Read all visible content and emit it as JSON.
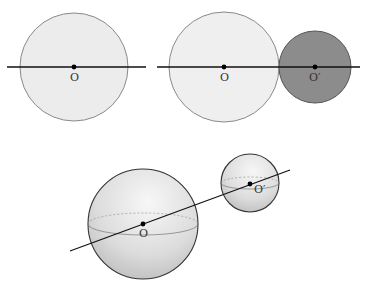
{
  "figures": [
    {
      "id": "single-circle",
      "circle": {
        "cx": 74,
        "cy": 67,
        "r": 54,
        "fill": "#ececec",
        "stroke": "#8a8a8a"
      },
      "line": {
        "x1": 7,
        "y1": 67,
        "x2": 146,
        "y2": 67
      },
      "center_label": "O"
    },
    {
      "id": "two-circles",
      "circle_large": {
        "cx": 224,
        "cy": 67,
        "r": 55,
        "fill": "#efefef",
        "stroke": "#8a8a8a"
      },
      "circle_small": {
        "cx": 315,
        "cy": 67,
        "r": 36,
        "fill": "#8c8c8c",
        "stroke": "#555555"
      },
      "line": {
        "x1": 157,
        "y1": 67,
        "x2": 360,
        "y2": 67
      },
      "center_label_large": "O",
      "center_label_small": "O′"
    },
    {
      "id": "two-spheres",
      "sphere_large": {
        "cx": 143,
        "cy": 224,
        "r": 55
      },
      "sphere_small": {
        "cx": 250,
        "cy": 183,
        "r": 29
      },
      "line": {
        "x1": 70,
        "y1": 251,
        "x2": 290,
        "y2": 170
      },
      "center_label_large": "O",
      "center_label_small": "O′"
    }
  ],
  "colors": {
    "line": "#111111",
    "point": "#000000",
    "sphere_light": "#f4f4f4",
    "sphere_dark": "#b5b5b5"
  }
}
